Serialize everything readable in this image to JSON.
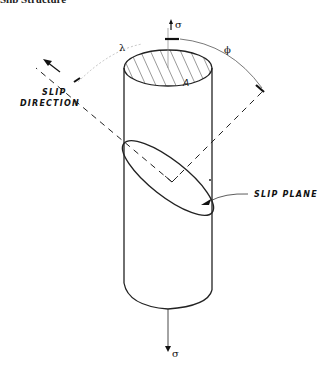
{
  "figure": {
    "clipped_header_text": "Slip Structure",
    "labels": {
      "slip_direction_line1": "SLIP",
      "slip_direction_line2": "DIRECTION",
      "slip_plane": "SLIP PLANE",
      "area": "A",
      "lambda": "λ",
      "phi": "ϕ",
      "sigma_top": "σ",
      "sigma_bottom": "σ"
    },
    "icons": [
      "arrow-up-icon",
      "arrow-down-icon",
      "arrow-slip-direction-icon",
      "arrow-pointer-icon"
    ],
    "colors": {
      "ink": "#111111",
      "background": "#ffffff"
    }
  }
}
